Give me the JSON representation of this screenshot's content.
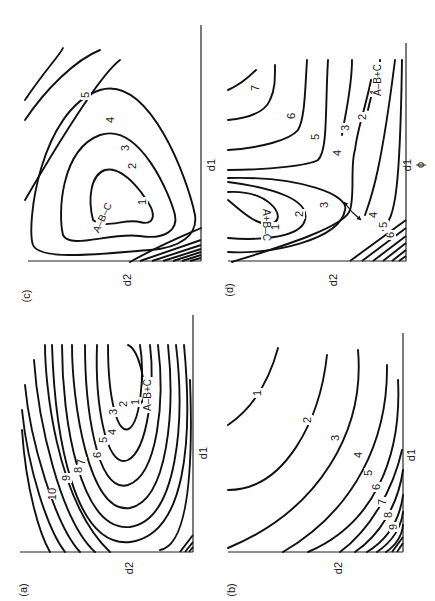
{
  "figure": {
    "orientation": "rotated 90 degrees counter-clockwise on page",
    "panels": [
      {
        "id": "c",
        "label": "(c)",
        "x_axis_label": "d1",
        "y_axis_label": "d2",
        "species_label": "A–B–C",
        "contour_levels": [
          "1",
          "2",
          "3",
          "4",
          "5"
        ],
        "label_pos": [
          27,
          296
        ],
        "xlabel_pos": [
          212,
          165
        ],
        "ylabel_pos": [
          128,
          280
        ],
        "axes": {
          "vx": 201,
          "vy0": 25,
          "vy1": 261,
          "hy": 261,
          "hx0": 28,
          "hx1": 201
        },
        "contours": [
          "M 93,220 C 88,200 90,175 105,170 C 125,165 148,200 152,210 C 155,220 150,225 140,222 C 125,218 105,230 93,220 Z",
          "M 63,235 C 58,215 60,150 100,135 C 140,122 170,195 175,215 C 178,230 165,240 140,236 C 110,232 70,250 63,235 Z",
          "M 33,245 C 26,225 40,110 100,90 C 150,75 188,180 195,215 C 198,235 180,248 150,250 C 110,253 40,262 33,245 Z",
          "M 25,200 C 60,140 100,75 120,60",
          "M 25,120 C 45,90 75,60 100,50",
          "M 25,100 C 45,70 60,55 63,48"
        ],
        "extra_contours_between": [
          "M 130,262 C 160,245 185,235 201,228"
        ],
        "hatch": [
          "M 140,261 L 201,240",
          "M 152,261 L 201,245",
          "M 163,261 L 201,249",
          "M 173,261 L 201,252",
          "M 182,261 L 201,255",
          "M 190,261 L 201,258"
        ],
        "labels": [
          {
            "text": "1",
            "x": 143,
            "y": 202,
            "rot": -90
          },
          {
            "text": "2",
            "x": 133,
            "y": 166,
            "rot": -90
          },
          {
            "text": "3",
            "x": 126,
            "y": 148,
            "rot": -90
          },
          {
            "text": "4",
            "x": 111,
            "y": 120,
            "rot": -90
          },
          {
            "text": "5",
            "x": 86,
            "y": 95,
            "rot": -90
          },
          {
            "text": "A–B–C",
            "x": 103,
            "y": 218,
            "rot": -65
          }
        ]
      },
      {
        "id": "d",
        "label": "(d)",
        "x_axis_label": "d1",
        "x_axis_sublabel": "ϕ",
        "y_axis_label": "d2",
        "species_labels": [
          "A+B–C",
          "A–B+C"
        ],
        "contour_levels": [
          "1",
          "2",
          "3",
          "4",
          "5",
          "6",
          "7"
        ],
        "label_pos": [
          230,
          290
        ],
        "xlabel_pos": [
          408,
          165
        ],
        "ylabel_pos": [
          334,
          280
        ],
        "axes": {
          "vx": 406,
          "vy0": 43,
          "vy1": 261,
          "hy": 261,
          "hx0": 228,
          "hx1": 406
        },
        "contours": [
          "M 228,200 C 240,210 260,230 275,222 C 285,215 268,190 228,192",
          "M 228,238 C 250,240 300,240 305,220 C 310,200 275,188 228,182",
          "M 228,252 C 270,255 340,240 345,210 C 350,195 300,176 228,178",
          "M 232,262 C 270,250 345,228 350,210 C 355,195 350,165 355,150 C 357,130 365,110 371,80",
          "M 365,215 C 370,200 380,180 395,60",
          "M 383,230 C 395,215 400,195 402,60",
          "M 368,110 C 372,90 380,70 380,60",
          "M 342,135 C 345,115 352,88 352,60",
          "M 228,170 C 270,170 310,165 318,160 C 328,150 325,110 328,60",
          "M 228,150 C 260,148 290,140 298,130 C 305,118 305,90 307,60",
          "M 228,120 C 250,118 265,112 270,100 C 275,90 275,80 275,65",
          "M 228,90 C 240,85 248,78 256,70"
        ],
        "hatch": [
          "M 350,261 L 406,220",
          "M 362,261 L 406,228",
          "M 373,261 L 406,236",
          "M 383,261 L 406,243",
          "M 392,261 L 406,250",
          "M 399,261 L 406,256"
        ],
        "arrows": [
          {
            "x1": 352,
            "y1": 212,
            "x2": 344,
            "y2": 202
          },
          {
            "x1": 352,
            "y1": 212,
            "x2": 361,
            "y2": 220
          }
        ],
        "labels": [
          {
            "text": "1",
            "x": 276,
            "y": 227,
            "rot": -90
          },
          {
            "text": "2",
            "x": 300,
            "y": 214,
            "rot": -90
          },
          {
            "text": "3",
            "x": 325,
            "y": 205,
            "rot": -90
          },
          {
            "text": "3",
            "x": 346,
            "y": 128,
            "rot": -90
          },
          {
            "text": "2",
            "x": 363,
            "y": 117,
            "rot": -90
          },
          {
            "text": "1",
            "x": 375,
            "y": 92,
            "rot": -90
          },
          {
            "text": "4",
            "x": 338,
            "y": 153,
            "rot": -90
          },
          {
            "text": "4",
            "x": 374,
            "y": 215,
            "rot": -90
          },
          {
            "text": "5",
            "x": 316,
            "y": 137,
            "rot": -90
          },
          {
            "text": "5",
            "x": 384,
            "y": 225,
            "rot": -90
          },
          {
            "text": "6",
            "x": 292,
            "y": 116,
            "rot": -90
          },
          {
            "text": "6",
            "x": 391,
            "y": 235,
            "rot": -90
          },
          {
            "text": "7",
            "x": 256,
            "y": 88,
            "rot": -90
          },
          {
            "text": "A+B–C",
            "x": 266,
            "y": 225,
            "rot": 90
          },
          {
            "text": "A–B+C",
            "x": 378,
            "y": 80,
            "rot": -90
          }
        ]
      },
      {
        "id": "a",
        "label": "(a)",
        "x_axis_label": "d1",
        "y_axis_label": "d2",
        "species_label": "A–B+C",
        "contour_levels": [
          "1",
          "2",
          "3",
          "4",
          "5",
          "6",
          "7",
          "8",
          "9",
          "10"
        ],
        "label_pos": [
          24,
          590
        ],
        "xlabel_pos": [
          204,
          453
        ],
        "ylabel_pos": [
          130,
          568
        ],
        "axes": {
          "vx": 193,
          "vy0": 315,
          "vy1": 552,
          "hy": 552,
          "hx0": 20,
          "hx1": 193
        },
        "contours": [
          "M 128,345 C 140,350 147,390 143,400 C 139,408 132,406 133,400",
          "M 140,345 C 145,375 140,420 130,428 C 118,438 108,400 108,345",
          "M 150,345 C 155,385 148,450 128,460 C 105,470 95,400 97,345",
          "M 158,345 C 165,400 158,475 128,485 C 95,495 85,400 85,345",
          "M 168,345 C 175,410 168,500 130,508 C 88,515 72,400 72,345",
          "M 176,345 C 185,420 178,520 130,527 C 80,532 62,420 62,345",
          "M 184,345 C 193,440 186,535 130,542 C 75,548 55,440 52,345",
          "M 190,380 C 193,460 190,545 160,550",
          "M 45,345 C 45,380 55,500 110,552",
          "M 34,360 C 38,420 60,520 95,552",
          "M 25,385 C 30,440 55,525 80,552",
          "M 22,410 C 28,470 48,530 65,552",
          "M 22,430 C 26,490 40,535 50,552"
        ],
        "hatch": [
          "M 180,552 L 193,535",
          "M 185,552 L 193,542",
          "M 189,552 L 193,547"
        ],
        "labels": [
          {
            "text": "1",
            "x": 136,
            "y": 402,
            "rot": -90
          },
          {
            "text": "2",
            "x": 124,
            "y": 404,
            "rot": -90
          },
          {
            "text": "3",
            "x": 114,
            "y": 412,
            "rot": -90
          },
          {
            "text": "4",
            "x": 113,
            "y": 432,
            "rot": -90
          },
          {
            "text": "5",
            "x": 104,
            "y": 440,
            "rot": -90
          },
          {
            "text": "6",
            "x": 98,
            "y": 455,
            "rot": -90
          },
          {
            "text": "7",
            "x": 82,
            "y": 462,
            "rot": -90
          },
          {
            "text": "8",
            "x": 79,
            "y": 470,
            "rot": -90
          },
          {
            "text": "9",
            "x": 67,
            "y": 478,
            "rot": -90
          },
          {
            "text": "10",
            "x": 53,
            "y": 494,
            "rot": -90
          },
          {
            "text": "A–B+C",
            "x": 148,
            "y": 395,
            "rot": -90
          }
        ]
      },
      {
        "id": "b",
        "label": "(b)",
        "x_axis_label": "d1",
        "y_axis_label": "d2",
        "contour_levels": [
          "1",
          "2",
          "3",
          "4",
          "5",
          "6",
          "7",
          "8",
          "9"
        ],
        "label_pos": [
          232,
          590
        ],
        "xlabel_pos": [
          412,
          455
        ],
        "ylabel_pos": [
          339,
          568
        ],
        "axes": {
          "vx": 403,
          "vy0": 333,
          "vy1": 552,
          "hy": 552,
          "hx0": 228,
          "hx1": 403
        },
        "contours": [
          "M 278,348 C 268,385 250,410 228,425",
          "M 327,355 C 320,420 285,490 228,490",
          "M 358,350 C 365,430 320,510 228,548",
          "M 387,365 C 388,440 355,510 283,552",
          "M 398,380 C 402,460 372,525 308,552",
          "M 340,552 C 370,530 393,490 402,450",
          "M 355,552 C 380,535 398,505 403,470",
          "M 367,552 C 390,538 400,518 403,495",
          "M 377,552 C 393,541 401,528 403,512",
          "M 386,552 C 396,545 402,535 403,525"
        ],
        "hatch": [
          "M 392,552 L 403,537",
          "M 397,552 L 403,543"
        ],
        "labels": [
          {
            "text": "1",
            "x": 258,
            "y": 393,
            "rot": -90
          },
          {
            "text": "2",
            "x": 308,
            "y": 420,
            "rot": -90
          },
          {
            "text": "3",
            "x": 336,
            "y": 438,
            "rot": -90
          },
          {
            "text": "4",
            "x": 359,
            "y": 455,
            "rot": -90
          },
          {
            "text": "5",
            "x": 369,
            "y": 473,
            "rot": -90
          },
          {
            "text": "6",
            "x": 377,
            "y": 487,
            "rot": -90
          },
          {
            "text": "7",
            "x": 383,
            "y": 502,
            "rot": -90
          },
          {
            "text": "8",
            "x": 389,
            "y": 515,
            "rot": -90
          },
          {
            "text": "9",
            "x": 394,
            "y": 527,
            "rot": -90
          }
        ]
      }
    ]
  }
}
